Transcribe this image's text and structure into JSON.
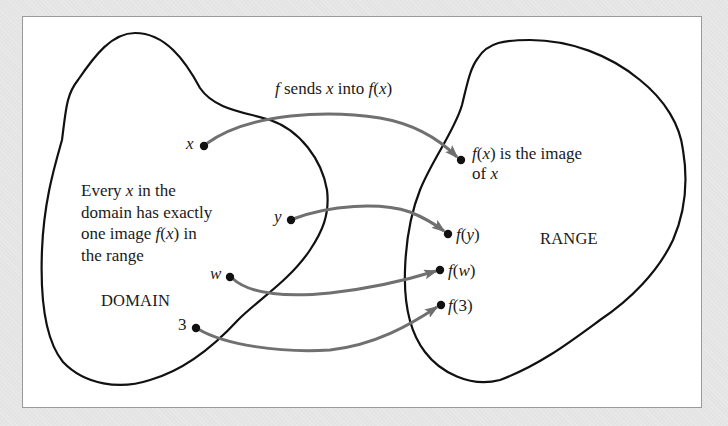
{
  "diagram": {
    "title": "f sends x into f(x)",
    "title_parts": {
      "f": "f",
      "sends": " sends ",
      "x": "x",
      "into": " into ",
      "fx": "f",
      "paren_open": "(",
      "arg": "x",
      "paren_close": ")"
    },
    "domain_label": "DOMAIN",
    "range_label": "RANGE",
    "domain_description": {
      "lines": [
        {
          "a": "Every ",
          "b": "x",
          "c": " in the"
        },
        {
          "a": "domain has exactly",
          "b": "",
          "c": ""
        },
        {
          "a": "one image ",
          "b": "f",
          "c": "(",
          "d": "x",
          "e": ") in"
        },
        {
          "a": "the range",
          "b": "",
          "c": ""
        }
      ]
    },
    "image_note": {
      "line1": {
        "f": "f",
        "open": "(",
        "x": "x",
        "rest": ") is the image"
      },
      "line2": {
        "of": "of ",
        "x": "x"
      }
    },
    "domain_points": [
      {
        "label": "x",
        "cx": 204,
        "cy": 146
      },
      {
        "label": "y",
        "cx": 291,
        "cy": 220
      },
      {
        "label": "w",
        "cx": 230,
        "cy": 277
      },
      {
        "label": "3",
        "cx": 196,
        "cy": 328
      }
    ],
    "range_points": [
      {
        "label_f": "f",
        "label_arg": "x",
        "cx": 461,
        "cy": 160
      },
      {
        "label_f": "f",
        "label_arg": "y",
        "cx": 448,
        "cy": 234
      },
      {
        "label_f": "f",
        "label_arg": "w",
        "cx": 440,
        "cy": 270
      },
      {
        "label_f": "f",
        "label_arg": "3",
        "cx": 441,
        "cy": 305
      }
    ],
    "mappings": [
      {
        "from": "x",
        "to": "f(x)"
      },
      {
        "from": "y",
        "to": "f(y)"
      },
      {
        "from": "w",
        "to": "f(w)"
      },
      {
        "from": "3",
        "to": "f(3)"
      }
    ],
    "colors": {
      "outline": "#111111",
      "arrow": "#707070",
      "point": "#111111",
      "panel": "#ffffff",
      "background": "#e4e4e4"
    }
  }
}
